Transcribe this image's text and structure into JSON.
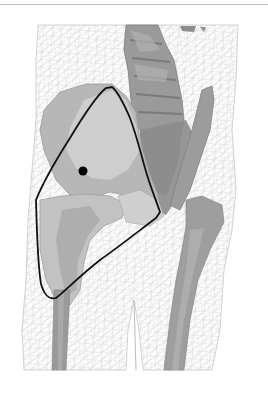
{
  "figure": {
    "colors": {
      "background": "#ffffff",
      "mesh": "#c4c4c4",
      "bone_light": "#d2d2d2",
      "bone_mid": "#a8a8a8",
      "bone_dark": "#8a8a8a",
      "outline": "#111111",
      "marker": "#000000",
      "top_rule": "#bdbdbd"
    },
    "annotation": {
      "outline_points": [
        [
          112,
          87
        ],
        [
          126,
          110
        ],
        [
          138,
          140
        ],
        [
          145,
          170
        ],
        [
          155,
          195
        ],
        [
          160,
          212
        ],
        [
          154,
          218
        ],
        [
          120,
          245
        ],
        [
          85,
          272
        ],
        [
          58,
          298
        ],
        [
          47,
          295
        ],
        [
          38,
          260
        ],
        [
          36,
          200
        ],
        [
          55,
          165
        ],
        [
          80,
          125
        ],
        [
          100,
          97
        ]
      ],
      "marker": {
        "cx": 83,
        "cy": 171,
        "r": 4.5
      }
    }
  }
}
